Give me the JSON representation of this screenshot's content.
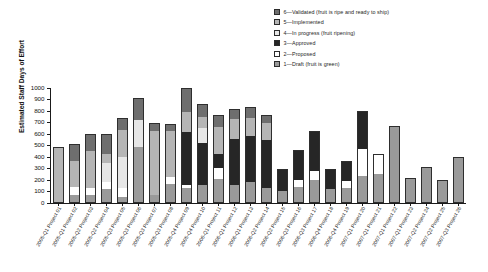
{
  "chart_data": {
    "type": "bar",
    "subtype": "stacked-bar",
    "title": "",
    "xlabel": "",
    "ylabel": "Estimated Staff Days of Effort",
    "ylim": [
      0,
      1000
    ],
    "ytick_values": [
      0,
      100,
      200,
      300,
      400,
      500,
      600,
      700,
      800,
      900,
      1000
    ],
    "ytick_labels": [
      "0",
      "100",
      "200",
      "300",
      "400",
      "500",
      "600",
      "700",
      "800",
      "900",
      "1000"
    ],
    "grid": false,
    "legend_position": "top-right",
    "legend_title": "",
    "categories": [
      "2005-Q1 Project 01",
      "2005-Q1 Project 02",
      "2005-Q2 Project 03",
      "2005-Q2 Project 04",
      "2005-Q3 Project 05",
      "2005-Q3 Project 06",
      "2005-Q3 Project 07",
      "2005-Q3 Project 08",
      "2005-Q4 Project 09",
      "2005-Q4 Project 10",
      "2006-Q1 Project 11",
      "2006-Q1 Project 12",
      "2006-Q1 Project 13",
      "2006-Q2 Project 14",
      "2006-Q2 Project 15",
      "2006-Q3 Project 16",
      "2006-Q3 Project 17",
      "2006-Q4 Project 18",
      "2006-Q4 Project 19",
      "2007-Q1 Project 20",
      "2007-Q1 Project 21",
      "2007-Q1 Project 22",
      "2007-Q1 Project 23",
      "2007-Q2 Project 24",
      "2007-Q2 Project 25",
      "2007-Q3 Project 26"
    ],
    "series": [
      {
        "name": "1 — Draft (fruit is green)",
        "key": "draft",
        "color": "#9a9a9a",
        "values": [
          0,
          60,
          60,
          110,
          40,
          480,
          60,
          160,
          120,
          150,
          200,
          150,
          170,
          120,
          100,
          130,
          190,
          110,
          120,
          230,
          240,
          650,
          200,
          300,
          180,
          380
        ]
      },
      {
        "name": "2 — Proposed",
        "key": "proposed",
        "color": "#ffffff",
        "values": [
          0,
          70,
          60,
          60,
          80,
          0,
          0,
          60,
          30,
          0,
          100,
          0,
          0,
          0,
          0,
          60,
          80,
          0,
          60,
          230,
          170,
          0,
          0,
          0,
          0,
          0
        ]
      },
      {
        "name": "3 — Approved",
        "key": "approved",
        "color": "#262626",
        "values": [
          0,
          0,
          0,
          0,
          0,
          0,
          0,
          0,
          460,
          360,
          120,
          400,
          400,
          420,
          180,
          250,
          340,
          170,
          170,
          320,
          0,
          0,
          0,
          0,
          0,
          0
        ]
      },
      {
        "name": "4 — In progress (fruit ripening)",
        "key": "in_progress",
        "color": "#e6e6e6",
        "values": [
          0,
          0,
          0,
          170,
          270,
          230,
          0,
          0,
          0,
          130,
          0,
          0,
          0,
          0,
          0,
          0,
          0,
          0,
          0,
          0,
          0,
          0,
          0,
          0,
          0,
          0
        ]
      },
      {
        "name": "5 — Implemented",
        "key": "implemented",
        "color": "#b5b5b5",
        "values": [
          470,
          230,
          320,
          80,
          240,
          0,
          560,
          400,
          170,
          100,
          230,
          170,
          160,
          150,
          0,
          0,
          0,
          0,
          0,
          0,
          0,
          0,
          0,
          0,
          0,
          0
        ]
      },
      {
        "name": "6 — Validated (fruit is ripe and ready to ship)",
        "key": "validated",
        "color": "#6e6e6e",
        "values": [
          0,
          140,
          140,
          160,
          90,
          190,
          60,
          50,
          200,
          100,
          100,
          80,
          90,
          60,
          0,
          0,
          0,
          0,
          0,
          0,
          0,
          0,
          0,
          0,
          0,
          0
        ]
      }
    ],
    "totals": [
      470,
      500,
      580,
      580,
      720,
      900,
      680,
      670,
      980,
      840,
      750,
      800,
      820,
      750,
      280,
      440,
      610,
      280,
      350,
      780,
      410,
      650,
      200,
      300,
      180,
      380
    ]
  },
  "legend": {
    "items": [
      {
        "label": "6—Validated (fruit is ripe and ready to ship)",
        "color": "#6e6e6e"
      },
      {
        "label": "5—Implemented",
        "color": "#b5b5b5"
      },
      {
        "label": "4—In progress (fruit ripening)",
        "color": "#e6e6e6"
      },
      {
        "label": "3—Approved",
        "color": "#262626"
      },
      {
        "label": "2—Proposed",
        "color": "#ffffff"
      },
      {
        "label": "1—Draft (fruit is green)",
        "color": "#9a9a9a"
      }
    ]
  }
}
